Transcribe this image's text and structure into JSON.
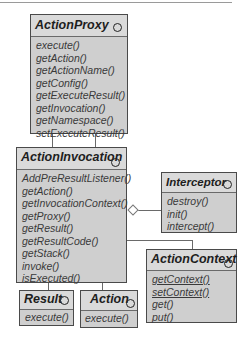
{
  "diagram": {
    "type": "UML class diagram",
    "classes": [
      {
        "name": "ActionProxy",
        "operations": [
          {
            "label": "execute()"
          },
          {
            "label": "getAction()"
          },
          {
            "label": "getActionName()"
          },
          {
            "label": "getConfig()"
          },
          {
            "label": "getExecuteResult()"
          },
          {
            "label": "getInvocation()"
          },
          {
            "label": "getNamespace()"
          },
          {
            "label": "setExecuteResult()"
          }
        ]
      },
      {
        "name": "ActionInvocation",
        "operations": [
          {
            "label": "AddPreResultListener()"
          },
          {
            "label": "getAction()"
          },
          {
            "label": "getInvocationContext()"
          },
          {
            "label": "getProxy()"
          },
          {
            "label": "getResult()"
          },
          {
            "label": "getResultCode()"
          },
          {
            "label": "getStack()"
          },
          {
            "label": "invoke()"
          },
          {
            "label": "isExecuted()"
          }
        ]
      },
      {
        "name": "Interceptor",
        "operations": [
          {
            "label": "destroy()"
          },
          {
            "label": "init()"
          },
          {
            "label": "intercept()"
          }
        ]
      },
      {
        "name": "ActionContext",
        "operations": [
          {
            "label": "getContext()",
            "static": true
          },
          {
            "label": "setContext()",
            "static": true
          },
          {
            "label": "get()"
          },
          {
            "label": "put()"
          }
        ]
      },
      {
        "name": "Result",
        "operations": [
          {
            "label": "execute()"
          }
        ]
      },
      {
        "name": "Action",
        "operations": [
          {
            "label": "execute()"
          }
        ]
      }
    ],
    "relationships": [
      {
        "from": "ActionProxy",
        "to": "ActionInvocation",
        "type": "association"
      },
      {
        "from": "ActionProxy",
        "to": "ActionInvocation",
        "type": "association"
      },
      {
        "from": "ActionInvocation",
        "to": "Interceptor",
        "type": "aggregation"
      },
      {
        "from": "ActionInvocation",
        "to": "ActionContext",
        "type": "association"
      },
      {
        "from": "ActionInvocation",
        "to": "Result",
        "type": "association"
      },
      {
        "from": "ActionInvocation",
        "to": "Action",
        "type": "association"
      }
    ],
    "colors": {
      "border": "#4a4a4a",
      "header_fill": "#dadada",
      "body_fill": "#cfcfcf",
      "text": "#3a3a3a"
    }
  }
}
